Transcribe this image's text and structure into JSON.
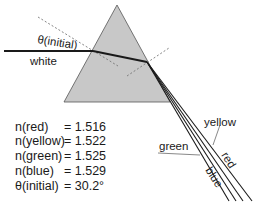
{
  "diagram": {
    "type": "prism-dispersion",
    "colors": {
      "prism_fill": "#c8c8c8",
      "prism_stroke": "#555555",
      "ray": "#1a1a1a",
      "normal": "#777777"
    },
    "labels": {
      "incident_ray": "white",
      "angle": "θ(initial)",
      "rays": {
        "yellow": "yellow",
        "green": "green",
        "red": "red",
        "blue": "blue"
      }
    },
    "table": [
      {
        "name": "n(red)",
        "eq": "= 1.516"
      },
      {
        "name": "n(yellow)",
        "eq": "= 1.522"
      },
      {
        "name": "n(green)",
        "eq": "= 1.525"
      },
      {
        "name": "n(blue)",
        "eq": "= 1.529"
      },
      {
        "name": "θ(initial)",
        "eq": "= 30.2°"
      }
    ]
  }
}
